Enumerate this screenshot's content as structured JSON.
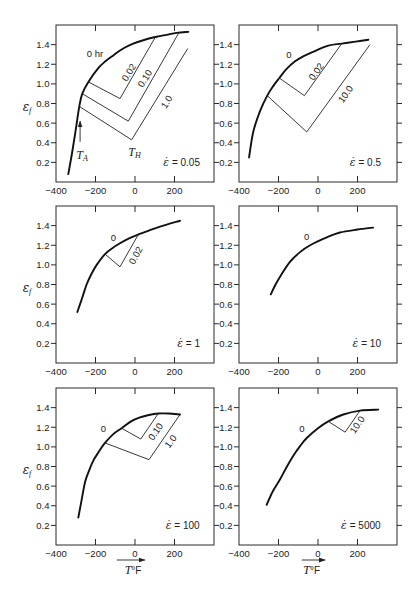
{
  "figure": {
    "ylabel": {
      "symbol": "ε",
      "sub": "f"
    },
    "xlabel": {
      "symbol": "T",
      "unit": "°F"
    }
  },
  "chart_data": [
    {
      "type": "line",
      "title": "ε̇ = 0.05",
      "strain_rate": {
        "symbol": "ε̇",
        "value": "= 0.05",
        "x": 329,
        "y": 0.2
      },
      "xlabel": "",
      "ylabel": "ε_f",
      "show_ylabel": true,
      "show_xlabel": false,
      "xlim": [
        -400,
        400
      ],
      "ylim": [
        0,
        1.6
      ],
      "grid": false,
      "xticks": [
        -400,
        -200,
        0,
        200
      ],
      "xtick_labels": [
        "−400",
        "−200",
        "0",
        "200"
      ],
      "yticks": [
        0.2,
        0.4,
        0.6,
        0.8,
        1.0,
        1.2,
        1.4
      ],
      "ytick_labels": [
        "0.2",
        "0.4",
        "0.6",
        "0.8",
        "1.0",
        "1.2",
        "1.4"
      ],
      "series": [
        {
          "name": "0 hr",
          "style": "bold",
          "points": [
            [
              -338,
              0.08
            ],
            [
              -320,
              0.28
            ],
            [
              -301,
              0.52
            ],
            [
              -282,
              0.77
            ],
            [
              -267,
              0.9
            ],
            [
              -236,
              1.02
            ],
            [
              -186,
              1.16
            ],
            [
              -150,
              1.23
            ],
            [
              -110,
              1.29
            ],
            [
              -60,
              1.36
            ],
            [
              -9,
              1.41
            ],
            [
              50,
              1.45
            ],
            [
              110,
              1.48
            ],
            [
              160,
              1.5
            ],
            [
              211,
              1.52
            ],
            [
              270,
              1.53
            ]
          ]
        },
        {
          "name": "0.02",
          "style": "thin",
          "points": [
            [
              -236,
              1.02
            ],
            [
              -76,
              0.85
            ],
            [
              101,
              1.47
            ]
          ]
        },
        {
          "name": "0.10",
          "style": "thin",
          "points": [
            [
              -267,
              0.9
            ],
            [
              -34,
              0.62
            ],
            [
              219,
              1.51
            ]
          ]
        },
        {
          "name": "1.0",
          "style": "thin",
          "points": [
            [
              -282,
              0.77
            ],
            [
              -17,
              0.43
            ],
            [
              267,
              1.36
            ]
          ]
        }
      ],
      "annotations": [
        {
          "kind": "label",
          "text": "0 hr",
          "x": -203,
          "y": 1.31
        },
        {
          "kind": "label",
          "text": "0.02",
          "x": -34,
          "y": 1.12,
          "rotate": -58
        },
        {
          "kind": "label",
          "text": "0.10",
          "x": 47,
          "y": 1.06,
          "rotate": -58
        },
        {
          "kind": "label",
          "text": "1.0",
          "x": 157,
          "y": 0.82,
          "rotate": -58
        },
        {
          "kind": "arrow",
          "x1": -278,
          "y1": 0.41,
          "x2": -278,
          "y2": 0.62
        },
        {
          "kind": "label",
          "text": "T",
          "sub": "A",
          "italic": true,
          "x": -268,
          "y": 0.275
        },
        {
          "kind": "label",
          "text": "T",
          "sub": "H",
          "italic": true,
          "x": -2,
          "y": 0.31
        }
      ]
    },
    {
      "type": "line",
      "title": "ε̇ = 0.5",
      "strain_rate": {
        "symbol": "ε̇",
        "value": "= 0.5",
        "x": 319,
        "y": 0.2
      },
      "xlabel": "",
      "ylabel": "ε_f",
      "show_ylabel": false,
      "show_xlabel": false,
      "xlim": [
        -400,
        400
      ],
      "ylim": [
        0,
        1.6
      ],
      "grid": false,
      "xticks": [
        -400,
        -200,
        0,
        200
      ],
      "xtick_labels": [
        "−400",
        "−200",
        "0",
        "200"
      ],
      "yticks": [
        0.2,
        0.4,
        0.6,
        0.8,
        1.0,
        1.2,
        1.4
      ],
      "ytick_labels": [
        "0.2",
        "0.4",
        "0.6",
        "0.8",
        "1.0",
        "1.2",
        "1.4"
      ],
      "series": [
        {
          "name": "0",
          "style": "bold",
          "points": [
            [
              -349,
              0.25
            ],
            [
              -328,
              0.51
            ],
            [
              -294,
              0.72
            ],
            [
              -257,
              0.88
            ],
            [
              -226,
              0.98
            ],
            [
              -196,
              1.06
            ],
            [
              -160,
              1.15
            ],
            [
              -116,
              1.23
            ],
            [
              -75,
              1.28
            ],
            [
              -32,
              1.32
            ],
            [
              52,
              1.39
            ],
            [
              120,
              1.41
            ],
            [
              190,
              1.43
            ],
            [
              255,
              1.45
            ]
          ]
        },
        {
          "name": "0.02",
          "style": "thin",
          "points": [
            [
              -196,
              1.06
            ],
            [
              -69,
              0.88
            ],
            [
              120,
              1.41
            ]
          ]
        },
        {
          "name": "10.0",
          "style": "thin",
          "points": [
            [
              -257,
              0.88
            ],
            [
              -57,
              0.51
            ],
            [
              263,
              1.4
            ]
          ]
        }
      ],
      "annotations": [
        {
          "kind": "label",
          "text": "0",
          "x": -147,
          "y": 1.3
        },
        {
          "kind": "label",
          "text": "0.02",
          "x": -12,
          "y": 1.13,
          "rotate": -55
        },
        {
          "kind": "label",
          "text": "10.0",
          "x": 137,
          "y": 0.9,
          "rotate": -55
        }
      ]
    },
    {
      "type": "line",
      "title": "ε̇ = 1",
      "strain_rate": {
        "symbol": "ε̇",
        "value": "= 1",
        "x": 329,
        "y": 0.2
      },
      "xlabel": "",
      "ylabel": "ε_f",
      "show_ylabel": true,
      "show_xlabel": false,
      "xlim": [
        -400,
        400
      ],
      "ylim": [
        0,
        1.6
      ],
      "grid": false,
      "xticks": [
        -400,
        -200,
        0,
        200
      ],
      "xtick_labels": [
        "−400",
        "−200",
        "0",
        "200"
      ],
      "yticks": [
        0.2,
        0.4,
        0.6,
        0.8,
        1.0,
        1.2,
        1.4
      ],
      "ytick_labels": [
        "0.2",
        "0.4",
        "0.6",
        "0.8",
        "1.0",
        "1.2",
        "1.4"
      ],
      "series": [
        {
          "name": "0",
          "style": "bold",
          "points": [
            [
              -292,
              0.52
            ],
            [
              -268,
              0.66
            ],
            [
              -245,
              0.8
            ],
            [
              -220,
              0.91
            ],
            [
              -194,
              1.0
            ],
            [
              -152,
              1.11
            ],
            [
              -115,
              1.17
            ],
            [
              -76,
              1.22
            ],
            [
              -30,
              1.27
            ],
            [
              17,
              1.31
            ],
            [
              70,
              1.35
            ],
            [
              127,
              1.39
            ],
            [
              228,
              1.45
            ]
          ]
        },
        {
          "name": "0.02",
          "style": "thin",
          "points": [
            [
              -152,
              1.11
            ],
            [
              -76,
              0.98
            ],
            [
              17,
              1.31
            ]
          ]
        }
      ],
      "annotations": [
        {
          "kind": "label",
          "text": "0",
          "x": -110,
          "y": 1.28
        },
        {
          "kind": "label",
          "text": "0.02",
          "x": 0,
          "y": 1.1,
          "rotate": -62
        }
      ]
    },
    {
      "type": "line",
      "title": "ε̇ = 10",
      "strain_rate": {
        "symbol": "ε̇",
        "value": "= 10",
        "x": 319,
        "y": 0.2
      },
      "xlabel": "",
      "ylabel": "ε_f",
      "show_ylabel": false,
      "show_xlabel": false,
      "xlim": [
        -400,
        400
      ],
      "ylim": [
        0,
        1.6
      ],
      "grid": false,
      "xticks": [
        -400,
        -200,
        0,
        200
      ],
      "xtick_labels": [
        "−400",
        "−200",
        "0",
        "200"
      ],
      "yticks": [
        0.2,
        0.4,
        0.6,
        0.8,
        1.0,
        1.2,
        1.4
      ],
      "ytick_labels": [
        "0.2",
        "0.4",
        "0.6",
        "0.8",
        "1.0",
        "1.2",
        "1.4"
      ],
      "series": [
        {
          "name": "0",
          "style": "bold",
          "points": [
            [
              -239,
              0.7
            ],
            [
              -215,
              0.8
            ],
            [
              -192,
              0.88
            ],
            [
              -142,
              1.03
            ],
            [
              -91,
              1.13
            ],
            [
              -40,
              1.2
            ],
            [
              44,
              1.28
            ],
            [
              111,
              1.33
            ],
            [
              200,
              1.36
            ],
            [
              279,
              1.38
            ]
          ]
        }
      ],
      "annotations": [
        {
          "kind": "label",
          "text": "0",
          "x": -57,
          "y": 1.29
        }
      ]
    },
    {
      "type": "line",
      "title": "ε̇ = 100",
      "strain_rate": {
        "symbol": "ε̇",
        "value": "= 100",
        "x": 327,
        "y": 0.2
      },
      "xlabel": "T°F",
      "ylabel": "ε_f",
      "show_ylabel": true,
      "show_xlabel": true,
      "xlabel_layout": {
        "x": -10,
        "arrow": [
          -92,
          50
        ]
      },
      "xlim": [
        -400,
        400
      ],
      "ylim": [
        0,
        1.6
      ],
      "grid": false,
      "xticks": [
        -400,
        -200,
        0,
        200
      ],
      "xtick_labels": [
        "−400",
        "−200",
        "0",
        "200"
      ],
      "yticks": [
        0.2,
        0.4,
        0.6,
        0.8,
        1.0,
        1.2,
        1.4
      ],
      "ytick_labels": [
        "0.2",
        "0.4",
        "0.6",
        "0.8",
        "1.0",
        "1.2",
        "1.4"
      ],
      "series": [
        {
          "name": "0",
          "style": "bold",
          "points": [
            [
              -287,
              0.28
            ],
            [
              -272,
              0.44
            ],
            [
              -253,
              0.64
            ],
            [
              -232,
              0.76
            ],
            [
              -211,
              0.86
            ],
            [
              -180,
              0.96
            ],
            [
              -152,
              1.04
            ],
            [
              -110,
              1.13
            ],
            [
              -68,
              1.19
            ],
            [
              -20,
              1.26
            ],
            [
              25,
              1.3
            ],
            [
              70,
              1.325
            ],
            [
              118,
              1.34
            ],
            [
              170,
              1.34
            ],
            [
              228,
              1.33
            ]
          ]
        },
        {
          "name": "0.10",
          "style": "thin",
          "points": [
            [
              -68,
              1.19
            ],
            [
              29,
              1.08
            ],
            [
              118,
              1.34
            ]
          ]
        },
        {
          "name": "1.0",
          "style": "thin",
          "points": [
            [
              -152,
              1.04
            ],
            [
              71,
              0.87
            ],
            [
              228,
              1.33
            ]
          ]
        }
      ],
      "annotations": [
        {
          "kind": "label",
          "text": "0",
          "x": -160,
          "y": 1.19
        },
        {
          "kind": "label",
          "text": "0.10",
          "x": 101,
          "y": 1.16,
          "rotate": -55
        },
        {
          "kind": "label",
          "text": "1.0",
          "x": 177,
          "y": 1.06,
          "rotate": -53
        }
      ]
    },
    {
      "type": "line",
      "title": "ε̇ = 5000",
      "strain_rate": {
        "symbol": "ε̇",
        "value": "= 5000",
        "x": 317,
        "y": 0.2
      },
      "xlabel": "T°F",
      "ylabel": "ε_f",
      "show_ylabel": false,
      "show_xlabel": true,
      "xlabel_layout": {
        "x": -32,
        "arrow": [
          -82,
          36
        ]
      },
      "xlim": [
        -400,
        400
      ],
      "ylim": [
        0,
        1.6
      ],
      "grid": false,
      "xticks": [
        -400,
        -200,
        0,
        200
      ],
      "xtick_labels": [
        "−400",
        "−200",
        "0",
        "200"
      ],
      "yticks": [
        0.2,
        0.4,
        0.6,
        0.8,
        1.0,
        1.2,
        1.4
      ],
      "ytick_labels": [
        "0.2",
        "0.4",
        "0.6",
        "0.8",
        "1.0",
        "1.2",
        "1.4"
      ],
      "series": [
        {
          "name": "0",
          "style": "bold",
          "points": [
            [
              -260,
              0.41
            ],
            [
              -228,
              0.55
            ],
            [
              -192,
              0.67
            ],
            [
              -160,
              0.79
            ],
            [
              -125,
              0.91
            ],
            [
              -90,
              1.01
            ],
            [
              -57,
              1.09
            ],
            [
              0,
              1.19
            ],
            [
              52,
              1.26
            ],
            [
              128,
              1.33
            ],
            [
              213,
              1.37
            ],
            [
              305,
              1.38
            ]
          ]
        },
        {
          "name": "10.0",
          "style": "thin",
          "points": [
            [
              52,
              1.26
            ],
            [
              137,
              1.15
            ],
            [
              213,
              1.37
            ]
          ]
        }
      ],
      "annotations": [
        {
          "kind": "label",
          "text": "0",
          "x": -82,
          "y": 1.19
        },
        {
          "kind": "label",
          "text": "10.0",
          "x": 196,
          "y": 1.23,
          "rotate": -56
        }
      ]
    }
  ]
}
